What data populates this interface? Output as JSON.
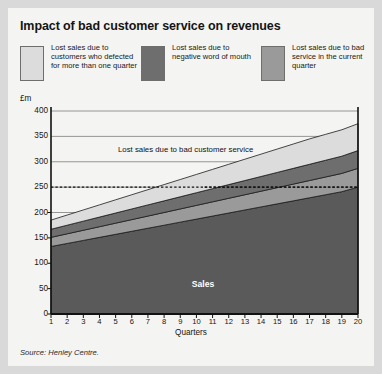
{
  "title": "Impact of bad customer service on revenues",
  "unit_label": "£m",
  "source": "Source: Henley Centre.",
  "annotation": "Lost sales due to bad customer service",
  "sales_label": "Sales",
  "colors": {
    "page_background": "#d9d9d9",
    "card_background": "#f4f4f2",
    "sales": "#5a5a5a",
    "bad_service": "#9a9a9a",
    "word_of_mouth": "#6e6e6e",
    "defected": "#dcdcdc",
    "gridline": "#8a8a8a",
    "axis": "#111111"
  },
  "legend": [
    {
      "label": "Lost sales due to customers who defected for more than one quarter",
      "color": "#dcdcdc",
      "key": "defected"
    },
    {
      "label": "Lost sales due to negative word of mouth",
      "color": "#6e6e6e",
      "key": "word_of_mouth"
    },
    {
      "label": "Lost sales due to bad service in the current quarter",
      "color": "#9a9a9a",
      "key": "bad_service"
    }
  ],
  "chart_data": {
    "type": "area",
    "stacked": true,
    "title": "Impact of bad customer service on revenues",
    "xlabel": "Quarters",
    "ylabel": "£m",
    "ylim": [
      0,
      400
    ],
    "yticks": [
      0,
      50,
      100,
      150,
      200,
      250,
      300,
      350,
      400
    ],
    "gridlines": [
      150,
      200,
      250,
      300,
      350,
      400
    ],
    "grid": true,
    "legend_position": "top",
    "x": [
      1,
      2,
      3,
      4,
      5,
      6,
      7,
      8,
      9,
      10,
      11,
      12,
      13,
      14,
      15,
      16,
      17,
      18,
      19,
      20
    ],
    "categories": [
      "1",
      "2",
      "3",
      "4",
      "5",
      "6",
      "7",
      "8",
      "9",
      "10",
      "11",
      "12",
      "13",
      "14",
      "15",
      "16",
      "17",
      "18",
      "19",
      "20"
    ],
    "series": [
      {
        "name": "Sales",
        "color": "#5a5a5a",
        "values": [
          133,
          139,
          145,
          151,
          157,
          163,
          169,
          175,
          181,
          187,
          193,
          199,
          205,
          211,
          217,
          223,
          229,
          235,
          241,
          250
        ]
      },
      {
        "name": "Lost sales due to bad service in the current quarter",
        "color": "#9a9a9a",
        "values": [
          18,
          19,
          20,
          21,
          22,
          23,
          24,
          25,
          26,
          27,
          28,
          29,
          30,
          31,
          32,
          33,
          34,
          35,
          36,
          37
        ]
      },
      {
        "name": "Lost sales due to negative word of mouth",
        "color": "#6e6e6e",
        "values": [
          16,
          17,
          18,
          19,
          20,
          21,
          22,
          23,
          24,
          25,
          26,
          27,
          28,
          29,
          30,
          31,
          32,
          33,
          34,
          35
        ]
      },
      {
        "name": "Lost sales due to customers who defected for more than one quarter",
        "color": "#dcdcdc",
        "values": [
          18,
          20,
          22,
          24,
          26,
          28,
          30,
          32,
          34,
          36,
          38,
          40,
          42,
          44,
          46,
          48,
          50,
          51,
          52,
          53
        ]
      }
    ],
    "totals": [
      185,
      195,
      205,
      215,
      225,
      235,
      245,
      255,
      265,
      275,
      285,
      295,
      305,
      315,
      325,
      335,
      345,
      354,
      363,
      375
    ],
    "reference_lines": [
      {
        "value": 250,
        "style": "dashed",
        "from_x": 10.5,
        "to_x": 20
      },
      {
        "value": 250,
        "style": "dashed",
        "from_x": 1,
        "to_x": 20,
        "upper": true
      }
    ],
    "annotations": [
      {
        "text": "Lost sales due to bad customer service",
        "x": 8,
        "y": 290
      },
      {
        "text": "Sales",
        "x": 10.5,
        "y": 65
      }
    ]
  }
}
